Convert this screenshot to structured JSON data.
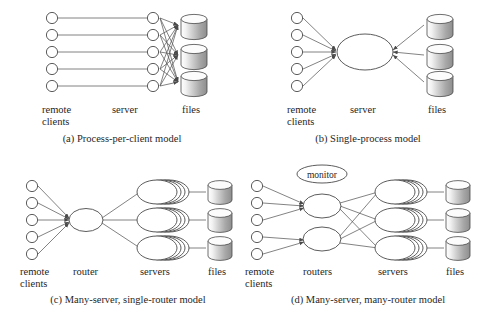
{
  "figure": {
    "colors": {
      "stroke": "#4a4a4a",
      "link": "#5a5a5a",
      "node_fill": "#ffffff",
      "text": "#1f1f1f",
      "cylinder_light": "#ffffff",
      "cylinder_dark": "#9a9a9a",
      "background": "#ffffff"
    }
  },
  "panels": [
    {
      "id": "a",
      "caption": "(a) Process-per-client model",
      "labels": {
        "left_line1": "remote",
        "left_line2": "clients",
        "middle": "server",
        "right": "files"
      },
      "counts": {
        "clients": 5,
        "servers": 5,
        "files": 3
      },
      "middle_shape": "circle",
      "topology": "each client paired one-to-one with a server process; every server process connects to every file store"
    },
    {
      "id": "b",
      "caption": "(b) Single-process model",
      "labels": {
        "left_line1": "remote",
        "left_line2": "clients",
        "middle": "server",
        "right": "files"
      },
      "counts": {
        "clients": 5,
        "servers": 1,
        "files": 3
      },
      "middle_shape": "ellipse",
      "topology": "all clients converge on a single server process; that process connects to all file stores"
    },
    {
      "id": "c",
      "caption": "(c) Many-server, single-router model",
      "labels": {
        "left_line1": "remote",
        "left_line2": "clients",
        "middle": "router",
        "middle2": "servers",
        "right": "files"
      },
      "counts": {
        "clients": 5,
        "routers": 1,
        "server_stacks": 3,
        "stack_depth": 4,
        "files": 3
      },
      "middle_shape": "ellipse",
      "topology": "clients converge on one router which fans out to three server stacks, each bound to one file store"
    },
    {
      "id": "d",
      "caption": "(d) Many-server, many-router model",
      "labels": {
        "left_line1": "remote",
        "left_line2": "clients",
        "middle": "routers",
        "middle2": "servers",
        "right": "files",
        "monitor": "monitor"
      },
      "counts": {
        "clients": 5,
        "routers": 2,
        "server_stacks": 3,
        "stack_depth": 4,
        "files": 3
      },
      "middle_shape": "ellipse",
      "topology": "clients split across two routers; both routers mesh to three server stacks, each bound to one file store; a monitor node oversees the routers"
    }
  ]
}
